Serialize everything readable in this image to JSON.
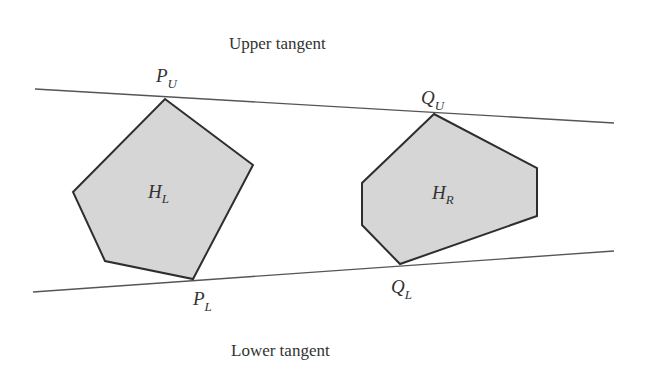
{
  "diagram": {
    "colors": {
      "background": "#ffffff",
      "hull_fill": "#d6d6d6",
      "hull_stroke": "#2e2e2e",
      "tangent_stroke": "#555555",
      "text": "#333333"
    },
    "captions": {
      "upper": "Upper tangent",
      "lower": "Lower tangent"
    },
    "hulls": [
      {
        "id": "left-hull",
        "label_main": "H",
        "label_sub": "L",
        "points": "165,99 253,165 193,279 105,261 73,192"
      },
      {
        "id": "right-hull",
        "label_main": "H",
        "label_sub": "R",
        "points": "434,114 537,168 537,216 400,264 362,225 362,183"
      }
    ],
    "tangents": [
      {
        "id": "upper-tangent",
        "x1": 35,
        "y1": 89,
        "x2": 614,
        "y2": 123
      },
      {
        "id": "lower-tangent",
        "x1": 33,
        "y1": 292,
        "x2": 614,
        "y2": 251
      }
    ],
    "vertex_labels": {
      "p_upper": {
        "main": "P",
        "sub": "U"
      },
      "q_upper": {
        "main": "Q",
        "sub": "U"
      },
      "p_lower": {
        "main": "P",
        "sub": "L"
      },
      "q_lower": {
        "main": "Q",
        "sub": "L"
      }
    }
  }
}
